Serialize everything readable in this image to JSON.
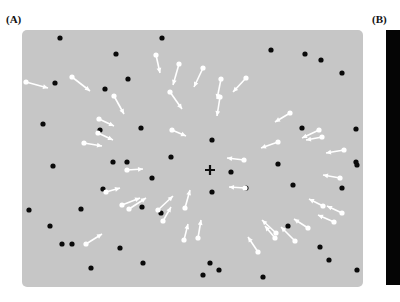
{
  "figure": {
    "panel_a_label": "(A)",
    "panel_b_label": "(B)",
    "colors": {
      "background": "#ffffff",
      "panel_a_fill": "#c6c6c6",
      "panel_b_fill": "#050505",
      "dot": "#0a0a0a",
      "arrow": "#ffffff",
      "focus_marker": "#111111"
    },
    "focus_of_expansion": {
      "x": 188,
      "y": 140,
      "symbol": "+"
    },
    "black_dots": [
      [
        38,
        8
      ],
      [
        140,
        8
      ],
      [
        94,
        24
      ],
      [
        249,
        20
      ],
      [
        106,
        49
      ],
      [
        33,
        53
      ],
      [
        83,
        59
      ],
      [
        299,
        30
      ],
      [
        320,
        43
      ],
      [
        283,
        24
      ],
      [
        21,
        94
      ],
      [
        78,
        100
      ],
      [
        119,
        98
      ],
      [
        190,
        110
      ],
      [
        334,
        99
      ],
      [
        149,
        127
      ],
      [
        280,
        98
      ],
      [
        105,
        132
      ],
      [
        209,
        142
      ],
      [
        256,
        134
      ],
      [
        335,
        135
      ],
      [
        81,
        159
      ],
      [
        91,
        132
      ],
      [
        31,
        136
      ],
      [
        190,
        162
      ],
      [
        271,
        155
      ],
      [
        320,
        158
      ],
      [
        224,
        158
      ],
      [
        334,
        132
      ],
      [
        7,
        180
      ],
      [
        59,
        179
      ],
      [
        120,
        177
      ],
      [
        130,
        148
      ],
      [
        28,
        196
      ],
      [
        139,
        183
      ],
      [
        50,
        214
      ],
      [
        98,
        218
      ],
      [
        40,
        214
      ],
      [
        69,
        238
      ],
      [
        121,
        233
      ],
      [
        188,
        233
      ],
      [
        241,
        247
      ],
      [
        197,
        240
      ],
      [
        307,
        230
      ],
      [
        335,
        240
      ],
      [
        266,
        196
      ],
      [
        298,
        217
      ],
      [
        181,
        245
      ]
    ],
    "arrows": [
      {
        "from": [
          4,
          52
        ],
        "to": [
          26,
          58
        ]
      },
      {
        "from": [
          50,
          47
        ],
        "to": [
          68,
          61
        ]
      },
      {
        "from": [
          134,
          25
        ],
        "to": [
          138,
          43
        ]
      },
      {
        "from": [
          157,
          34
        ],
        "to": [
          151,
          55
        ]
      },
      {
        "from": [
          181,
          38
        ],
        "to": [
          172,
          57
        ]
      },
      {
        "from": [
          92,
          66
        ],
        "to": [
          102,
          84
        ]
      },
      {
        "from": [
          148,
          62
        ],
        "to": [
          160,
          79
        ]
      },
      {
        "from": [
          199,
          49
        ],
        "to": [
          195,
          69
        ]
      },
      {
        "from": [
          198,
          67
        ],
        "to": [
          195,
          86
        ]
      },
      {
        "from": [
          224,
          48
        ],
        "to": [
          211,
          62
        ]
      },
      {
        "from": [
          77,
          89
        ],
        "to": [
          92,
          96
        ]
      },
      {
        "from": [
          76,
          103
        ],
        "to": [
          91,
          110
        ]
      },
      {
        "from": [
          62,
          113
        ],
        "to": [
          80,
          116
        ]
      },
      {
        "from": [
          105,
          140
        ],
        "to": [
          121,
          139
        ]
      },
      {
        "from": [
          150,
          100
        ],
        "to": [
          164,
          106
        ]
      },
      {
        "from": [
          268,
          83
        ],
        "to": [
          253,
          92
        ]
      },
      {
        "from": [
          297,
          100
        ],
        "to": [
          280,
          108
        ]
      },
      {
        "from": [
          256,
          112
        ],
        "to": [
          239,
          118
        ]
      },
      {
        "from": [
          300,
          107
        ],
        "to": [
          284,
          110
        ]
      },
      {
        "from": [
          322,
          120
        ],
        "to": [
          304,
          123
        ]
      },
      {
        "from": [
          100,
          175
        ],
        "to": [
          118,
          168
        ]
      },
      {
        "from": [
          84,
          162
        ],
        "to": [
          98,
          158
        ]
      },
      {
        "from": [
          136,
          180
        ],
        "to": [
          151,
          166
        ]
      },
      {
        "from": [
          64,
          214
        ],
        "to": [
          80,
          204
        ]
      },
      {
        "from": [
          107,
          179
        ],
        "to": [
          124,
          168
        ]
      },
      {
        "from": [
          141,
          191
        ],
        "to": [
          149,
          177
        ]
      },
      {
        "from": [
          163,
          178
        ],
        "to": [
          168,
          160
        ]
      },
      {
        "from": [
          176,
          208
        ],
        "to": [
          179,
          190
        ]
      },
      {
        "from": [
          162,
          210
        ],
        "to": [
          166,
          194
        ]
      },
      {
        "from": [
          187,
          147
        ],
        "to": [
          187,
          147
        ]
      },
      {
        "from": [
          223,
          158
        ],
        "to": [
          207,
          157
        ]
      },
      {
        "from": [
          222,
          130
        ],
        "to": [
          205,
          128
        ]
      },
      {
        "from": [
          318,
          148
        ],
        "to": [
          301,
          145
        ]
      },
      {
        "from": [
          320,
          183
        ],
        "to": [
          305,
          176
        ]
      },
      {
        "from": [
          301,
          176
        ],
        "to": [
          287,
          169
        ]
      },
      {
        "from": [
          254,
          203
        ],
        "to": [
          240,
          190
        ]
      },
      {
        "from": [
          273,
          211
        ],
        "to": [
          259,
          197
        ]
      },
      {
        "from": [
          236,
          222
        ],
        "to": [
          226,
          207
        ]
      },
      {
        "from": [
          253,
          208
        ],
        "to": [
          243,
          196
        ]
      },
      {
        "from": [
          286,
          198
        ],
        "to": [
          272,
          189
        ]
      },
      {
        "from": [
          312,
          192
        ],
        "to": [
          296,
          185
        ]
      }
    ]
  }
}
